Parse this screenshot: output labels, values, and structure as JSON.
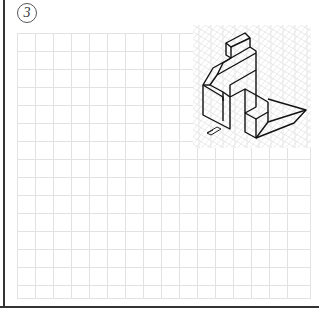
{
  "exercise": {
    "number": "3",
    "type": "isometric-to-orthographic drawing exercise"
  },
  "grid": {
    "cols": 16,
    "rows": 15,
    "cell_px": 18,
    "line_color": "#e0e0e0"
  },
  "isometric_panel": {
    "description": "Isometric view of a stepped block with a notch and sloped foot",
    "line_color": "#111111",
    "grid_color": "#dcdcdc",
    "view_arrow_icon": "direction-arrow"
  }
}
